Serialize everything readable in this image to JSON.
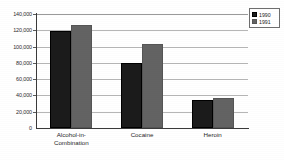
{
  "chart_data": {
    "type": "bar",
    "title": "",
    "subtitle": "",
    "xlabel": "",
    "ylabel": "",
    "categories": [
      "Alcohol-in-Combination",
      "Cocaine",
      "Heroin"
    ],
    "series": [
      {
        "name": "1990",
        "color": "#1b1b1b",
        "values": [
          119000,
          80000,
          34000
        ]
      },
      {
        "name": "1991",
        "color": "#636363",
        "values": [
          127000,
          103000,
          37000
        ]
      }
    ],
    "ylim": [
      0,
      140000
    ],
    "ytick_step": 20000,
    "yticks": [
      0,
      20000,
      40000,
      60000,
      80000,
      100000,
      120000,
      140000
    ],
    "ytick_labels": [
      "0",
      "20,000",
      "40,000",
      "60,000",
      "80,000",
      "100,000",
      "120,000",
      "140,000"
    ],
    "grid": true,
    "grid_axis": "y",
    "legend_position": "top-right",
    "bar_group_layout": "grouped"
  },
  "legend": {
    "entries": [
      {
        "label": "1990",
        "swatch": "dark-swatch"
      },
      {
        "label": "1991",
        "swatch": "gray-swatch"
      }
    ]
  },
  "axis": {
    "category_labels_multiline": [
      "Alcohol-in-\nCombination",
      "Cocaine",
      "Heroin"
    ]
  },
  "colors": {
    "series_1990": "#1b1b1b",
    "series_1991": "#636363",
    "gridline": "#b6b6b6",
    "axis": "#3a3a3a",
    "background": "#ffffff"
  }
}
